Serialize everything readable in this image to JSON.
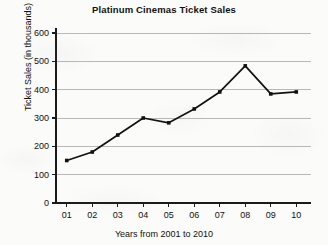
{
  "chart_data": {
    "type": "line",
    "title": "Platinum Cinemas Ticket Sales",
    "xlabel": "Years from 2001 to 2010",
    "ylabel": "Ticket Sales (in thousands)",
    "categories": [
      "01",
      "02",
      "03",
      "04",
      "05",
      "06",
      "07",
      "08",
      "09",
      "10"
    ],
    "values": [
      150,
      180,
      240,
      300,
      283,
      332,
      392,
      484,
      385,
      392
    ],
    "ylim": [
      0,
      600
    ],
    "y_ticks": [
      0,
      100,
      200,
      300,
      400,
      500,
      600
    ],
    "grid": "horizontal",
    "legend": "none",
    "series_color": "#111111",
    "gridline_color": "#b8b8b8",
    "axis_color": "#1a1a1a",
    "marker": "square"
  }
}
